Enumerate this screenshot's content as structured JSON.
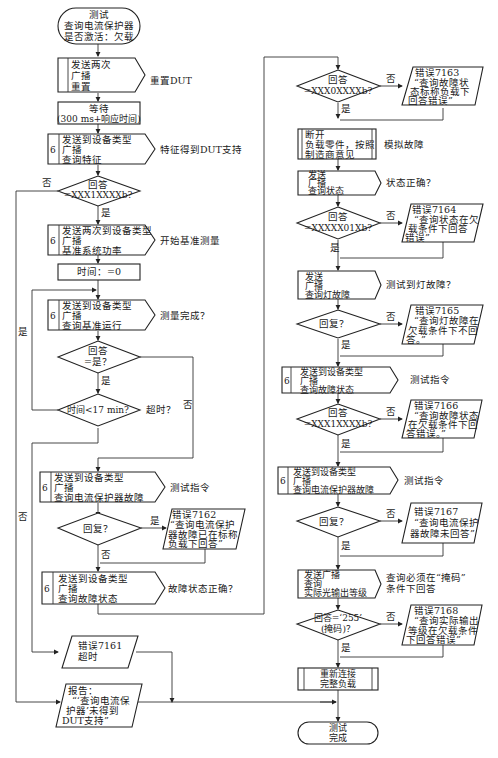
{
  "caption": "……",
  "nodes": {
    "start": [
      "测试",
      "查询电流保护器",
      "是否激活：欠载"
    ],
    "reset": [
      "发送两次",
      "广播",
      "重置"
    ],
    "reset_note": "重置DUT",
    "wait": [
      "等待",
      "(300 ms+响应时间)"
    ],
    "query_feature": [
      "发送到设备类型",
      "广播",
      "查询特征"
    ],
    "query_feature_num": "6",
    "query_feature_note": "特征得到DUT支持",
    "d_feature": [
      "回答",
      "=XXX1XXXXb?"
    ],
    "d_feature_no": "否",
    "d_feature_yes": "是",
    "ref_power": [
      "发送两次到设备类型",
      "广播",
      "基准系统功率"
    ],
    "ref_power_num": "6",
    "ref_power_note": "开始基准测量",
    "time_zero": "时间：=0",
    "query_ref": [
      "发送到设备类型",
      "广播",
      "查询基准运行"
    ],
    "query_ref_num": "6",
    "query_ref_note": "测量完成？",
    "d_answer_yes": [
      "回答",
      "=是？"
    ],
    "d_answer_yes_yes": "是",
    "d_answer_yes_no": "否",
    "d_time": "时间<17 min?",
    "d_time_note": "超时？",
    "d_time_yes": "是",
    "d_time_no": "否",
    "query_cp_fail": [
      "发送到设备类型",
      "广播",
      "查询电流保护器故障"
    ],
    "query_cp_fail_num": "6",
    "query_cp_fail_note": "测试指令",
    "d_reply1": "回复？",
    "d_reply1_yes": "是",
    "d_reply1_no": "否",
    "err7162": [
      "错误7162",
      "“查询电流保护",
      "器故障已在标称",
      "负载下回答”"
    ],
    "query_fault_state": [
      "发送到设备类型",
      "广播",
      "查询故障状态"
    ],
    "query_fault_state_num": "6",
    "query_fault_state_note": "故障状态正确？",
    "err7161": [
      "错误7161",
      "超时"
    ],
    "report": [
      "报告：",
      "“‘查询电流保",
      "护器’未得到",
      "DUT支持”"
    ],
    "d_xxx0": [
      "回答",
      "=XXX0XXXXb?"
    ],
    "d_xxx0_no": "否",
    "d_xxx0_yes": "是",
    "err7163": [
      "错误7163",
      "“查询故障状",
      "态标称负载下",
      "回答错误”"
    ],
    "disconnect": [
      "断开",
      "负载零件，按照",
      "制造商意见"
    ],
    "disconnect_note": "模拟故障",
    "query_status": [
      "发送",
      "广播",
      "查询状态"
    ],
    "query_status_note": "状态正确？",
    "d_status": [
      "回答",
      "=XXXXX01Xb?"
    ],
    "d_status_no": "否",
    "d_status_yes": "是",
    "err7164": [
      "错误7164",
      "“查询状态在欠",
      "载条件下回答",
      "错误”"
    ],
    "query_lamp": [
      "发送",
      "广播",
      "查询灯故障"
    ],
    "query_lamp_note": "测试到灯故障？",
    "d_reply2": "回复？",
    "d_reply2_no": "否",
    "d_reply2_yes": "是",
    "err7165": [
      "错误7165",
      "“查询灯故障在",
      "欠载条件下不回",
      "答。”"
    ],
    "query_fault_state2": [
      "发送到设备类型",
      "广播",
      "查询故障状态"
    ],
    "query_fault_state2_num": "6",
    "query_fault_state2_note": "测试指令",
    "d_xxx1": [
      "回答",
      "=XXX1XXXXb?"
    ],
    "d_xxx1_no": "否",
    "d_xxx1_yes": "是",
    "err7166": [
      "错误7166",
      "“查询故障状态",
      "在欠载条件下回",
      "答错误。”"
    ],
    "query_cp_fail2": [
      "发送到设备类型",
      "广播",
      "查询电流保护器故障"
    ],
    "query_cp_fail2_num": "6",
    "query_cp_fail2_note": "测试指令",
    "d_reply3": "回复？",
    "d_reply3_no": "否",
    "d_reply3_yes": "是",
    "err7167": [
      "错误7167",
      "“查询电流保护",
      "器故障未回答”"
    ],
    "query_light": [
      "发送广播",
      "查询",
      "实际光输出等级"
    ],
    "query_light_note": [
      "查询必须在“掩码”",
      "条件下回答"
    ],
    "d_255": [
      "回答=‘255’",
      "(掩码)？"
    ],
    "d_255_no": "否",
    "d_255_yes": "是",
    "err7168": [
      "错误7168",
      "“查询实际输出",
      "等级在欠载条件",
      "下回答错误”"
    ],
    "reconnect": [
      "重新连接",
      "完整负载"
    ],
    "end": [
      "测试",
      "完成"
    ]
  }
}
